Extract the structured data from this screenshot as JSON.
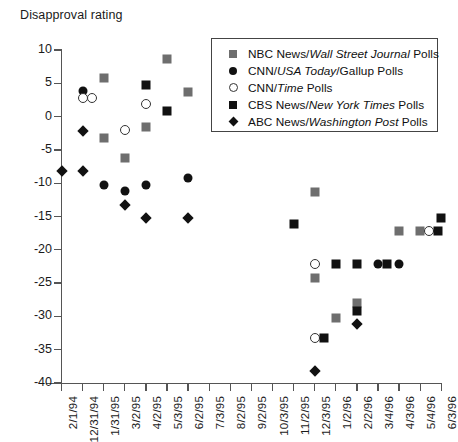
{
  "chart_data": {
    "type": "scatter",
    "title": "Disapproval rating",
    "xlabel": "",
    "ylabel": "",
    "ylim": [
      -40,
      10
    ],
    "y_ticks": [
      10,
      5,
      0,
      -5,
      -10,
      -15,
      -20,
      -25,
      -30,
      -35,
      -40
    ],
    "grid": false,
    "legend_position": "top-right",
    "categories": [
      "2/1/94",
      "12/31/94",
      "1/31/95",
      "3/2/95",
      "4/2/95",
      "5/3/95",
      "6/2/95",
      "7/3/95",
      "8/2/95",
      "9/2/95",
      "10/3/95",
      "11/2/95",
      "12/3/95",
      "1/2/96",
      "2/2/96",
      "3/4/96",
      "4/3/96",
      "5/4/96",
      "6/3/96"
    ],
    "series": [
      {
        "name": "NBC News/Wall Street Journal Polls",
        "marker": "square-gray",
        "color": "#6e6e6e",
        "points": [
          {
            "x": "1/31/95",
            "y": 5.8
          },
          {
            "x": "1/31/95",
            "y": -3.2
          },
          {
            "x": "3/2/95",
            "y": -6.2
          },
          {
            "x": "4/2/95",
            "y": -1.5
          },
          {
            "x": "5/3/95",
            "y": 8.7
          },
          {
            "x": "6/2/95",
            "y": 3.7
          },
          {
            "x": "12/3/95",
            "y": -11.3
          },
          {
            "x": "12/3/95",
            "y": -24.2
          },
          {
            "x": "1/2/96",
            "y": -30.2
          },
          {
            "x": "2/2/96",
            "y": -28.0
          },
          {
            "x": "4/3/96",
            "y": -17.2
          },
          {
            "x": "5/4/96",
            "y": -17.2
          }
        ]
      },
      {
        "name": "CNN/USA Today/Gallup Polls",
        "marker": "circle-filled",
        "color": "#111111",
        "points": [
          {
            "x": "12/31/94",
            "y": 3.9
          },
          {
            "x": "1/31/95",
            "y": -10.2
          },
          {
            "x": "3/2/95",
            "y": -11.2
          },
          {
            "x": "4/2/95",
            "y": -10.2
          },
          {
            "x": "6/2/95",
            "y": -9.2
          },
          {
            "x": "3/4/96",
            "y": -22.2
          },
          {
            "x": "4/3/96",
            "y": -22.2
          }
        ]
      },
      {
        "name": "CNN/Time Polls",
        "marker": "circle-open",
        "color": "#333333",
        "points": [
          {
            "x": "12/31/94",
            "y": 2.8
          },
          {
            "x": "12/31/94",
            "y": 2.8
          },
          {
            "x": "3/2/95",
            "y": -2.0
          },
          {
            "x": "4/2/95",
            "y": 1.9
          },
          {
            "x": "12/3/95",
            "y": -22.2
          },
          {
            "x": "12/3/95",
            "y": -33.2
          },
          {
            "x": "5/4/96",
            "y": -17.2
          }
        ]
      },
      {
        "name": "CBS News/New York Times Polls",
        "marker": "square-black",
        "color": "#111111",
        "points": [
          {
            "x": "4/2/95",
            "y": 4.7
          },
          {
            "x": "5/3/95",
            "y": 0.8
          },
          {
            "x": "11/2/95",
            "y": -16.2
          },
          {
            "x": "12/3/95",
            "y": -33.2
          },
          {
            "x": "1/2/96",
            "y": -22.2
          },
          {
            "x": "2/2/96",
            "y": -22.2
          },
          {
            "x": "2/2/96",
            "y": -29.2
          },
          {
            "x": "3/4/96",
            "y": -22.2
          },
          {
            "x": "5/4/96",
            "y": -17.2
          },
          {
            "x": "6/3/96",
            "y": -15.2
          }
        ]
      },
      {
        "name": "ABC News/Washington Post Polls",
        "marker": "diamond",
        "color": "#111111",
        "points": [
          {
            "x": "2/1/94",
            "y": -8.2
          },
          {
            "x": "12/31/94",
            "y": -2.2
          },
          {
            "x": "12/31/94",
            "y": -8.2
          },
          {
            "x": "3/2/95",
            "y": -13.2
          },
          {
            "x": "4/2/95",
            "y": -15.2
          },
          {
            "x": "6/2/95",
            "y": -15.2
          },
          {
            "x": "12/3/95",
            "y": -38.2
          },
          {
            "x": "2/2/96",
            "y": -31.2
          }
        ]
      }
    ]
  },
  "legend": {
    "items": [
      {
        "marker": "square-gray",
        "pre": "NBC News/",
        "em": "Wall Street Journal",
        "post": " Polls"
      },
      {
        "marker": "circle-filled",
        "pre": "CNN/",
        "em": "USA Today",
        "post": "/Gallup Polls"
      },
      {
        "marker": "circle-open",
        "pre": "CNN/",
        "em": "Time",
        "post": " Polls"
      },
      {
        "marker": "square-black",
        "pre": "CBS News/",
        "em": "New York Times",
        "post": " Polls"
      },
      {
        "marker": "diamond",
        "pre": "ABC News/",
        "em": "Washington Post",
        "post": " Polls"
      }
    ]
  }
}
